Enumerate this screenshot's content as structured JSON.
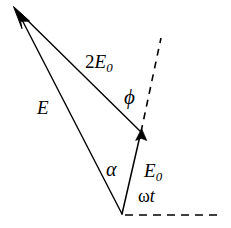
{
  "figure": {
    "background_color": "#ffffff",
    "stroke_color": "#000000",
    "width": 231,
    "height": 228
  },
  "labels": {
    "resultant_two_e0": {
      "coefficient": "2",
      "symbol": "E",
      "subscript": "0"
    },
    "resultant_e": {
      "symbol": "E"
    },
    "phase_phi": {
      "symbol": "ϕ"
    },
    "angle_alpha": {
      "symbol": "α"
    },
    "amplitude_e0": {
      "symbol": "E",
      "subscript": "0"
    },
    "angle_omega_t": {
      "omega": "ω",
      "t": "t"
    }
  },
  "vectors": [
    {
      "name": "E0",
      "label": "E₀",
      "from": [
        122,
        214
      ],
      "to": [
        141,
        132
      ],
      "style": "solid",
      "arrow": true
    },
    {
      "name": "2E0",
      "label": "2E₀",
      "from": [
        141,
        132
      ],
      "to": [
        16,
        9
      ],
      "style": "solid",
      "arrow": true
    },
    {
      "name": "E",
      "label": "E",
      "from": [
        122,
        214
      ],
      "to": [
        16,
        9
      ],
      "style": "solid",
      "arrow": true
    }
  ],
  "reference_lines": [
    {
      "name": "E0-extension",
      "from": [
        141,
        132
      ],
      "to": [
        161,
        38
      ],
      "style": "dashed"
    },
    {
      "name": "horizontal-axis",
      "from": [
        125,
        215
      ],
      "to": [
        222,
        215
      ],
      "style": "dashed"
    }
  ]
}
